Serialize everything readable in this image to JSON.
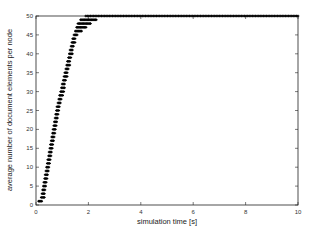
{
  "chart_data": {
    "type": "scatter",
    "title": "",
    "xlabel": "simulation time  [s]",
    "ylabel": "average number of document elements per node",
    "xlim": [
      0,
      10
    ],
    "ylim": [
      0,
      50
    ],
    "xticks": [
      0,
      2,
      4,
      6,
      8,
      10
    ],
    "yticks": [
      0,
      5,
      10,
      15,
      20,
      25,
      30,
      35,
      40,
      45,
      50
    ],
    "grid": false,
    "legend": null,
    "series": [
      {
        "name": "average elements per node",
        "marker": "+",
        "color": "#000000",
        "x": [
          0.1,
          0.2,
          0.3,
          0.4,
          0.5,
          0.6,
          0.7,
          0.8,
          0.9,
          1.0,
          1.1,
          1.2,
          1.3,
          1.4,
          1.5,
          1.6,
          1.7,
          1.8,
          1.9,
          2.0,
          3.0,
          4.0,
          5.0,
          6.0,
          7.0,
          8.0,
          9.0,
          10.0
        ],
        "values": [
          1,
          2,
          6,
          10,
          14,
          18,
          22,
          26,
          29,
          32,
          35,
          38,
          41,
          44,
          46,
          48,
          49,
          49.5,
          50,
          50,
          50,
          50,
          50,
          50,
          50,
          50,
          50,
          50
        ]
      }
    ]
  }
}
